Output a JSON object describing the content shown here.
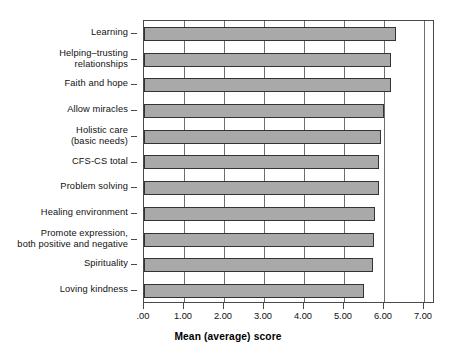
{
  "chart_data": {
    "type": "bar",
    "orientation": "horizontal",
    "title": "",
    "xlabel": "Mean (average) score",
    "ylabel": "",
    "xlim": [
      0,
      7.275
    ],
    "xticks": [
      0,
      1,
      2,
      3,
      4,
      5,
      6,
      7
    ],
    "xtick_labels": [
      ".00",
      "1.00",
      "2.00",
      "3.00",
      "4.00",
      "5.00",
      "6.00",
      "7.00"
    ],
    "grid": "vertical",
    "legend": "none",
    "bar_color": "#a9a9a9",
    "bar_edge_color": "#333333",
    "axis_color": "#4a4a4a",
    "categories": [
      "Learning",
      "Helping–trusting relationships",
      "Faith and hope",
      "Allow miracles",
      "Holistic care (basic needs)",
      "CFS-CS total",
      "Problem solving",
      "Healing environment",
      "Promote expression, both positive and negative",
      "Spirituality",
      "Loving kindness"
    ],
    "category_label_lines": [
      [
        "Learning"
      ],
      [
        "Helping–trusting",
        "relationships"
      ],
      [
        "Faith and hope"
      ],
      [
        "Allow miracles"
      ],
      [
        "Holistic care",
        "(basic needs)"
      ],
      [
        "CFS-CS total"
      ],
      [
        "Problem solving"
      ],
      [
        "Healing environment"
      ],
      [
        "Promote expression,",
        "both positive and negative"
      ],
      [
        "Spirituality"
      ],
      [
        "Loving kindness"
      ]
    ],
    "values": [
      6.3,
      6.18,
      6.18,
      6.0,
      5.93,
      5.88,
      5.88,
      5.78,
      5.75,
      5.73,
      5.5
    ]
  }
}
